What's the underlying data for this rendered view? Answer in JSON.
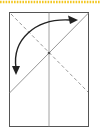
{
  "diagram": {
    "type": "origami-fold-step",
    "colors": {
      "background": "#ffffff",
      "paper_outline": "#555555",
      "crease_solid": "#8a8a8a",
      "crease_dashed": "#9a9a9a",
      "arrow": "#222222",
      "top_border": "#f2c61f"
    },
    "paper": {
      "x": 9,
      "y": 12,
      "width": 80,
      "height": 115
    },
    "lines": [
      {
        "kind": "vertical-center-crease",
        "style": "solid",
        "x1": 49,
        "y1": 12,
        "x2": 49,
        "y2": 127
      },
      {
        "kind": "fold-line",
        "style": "solid",
        "x1": 9,
        "y1": 93,
        "x2": 89,
        "y2": 13
      },
      {
        "kind": "valley-fold-guide",
        "style": "dashed",
        "x1": 11,
        "y1": 14,
        "x2": 88,
        "y2": 92
      }
    ],
    "arrow": {
      "kind": "fold-direction-double-arrow",
      "start": [
        16,
        72
      ],
      "end": [
        77,
        20
      ],
      "control": [
        12,
        12
      ]
    },
    "center_point": [
      49,
      53
    ]
  }
}
